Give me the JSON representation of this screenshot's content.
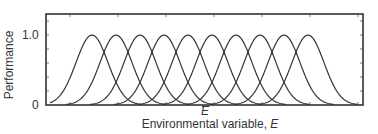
{
  "chart_data": {
    "type": "line",
    "title": "",
    "xlabel": "Environmental variable, E",
    "xlabel_text": "Environmental variable, ",
    "xlabel_var": "E",
    "ylabel": "Performance",
    "yticks": [
      "0",
      "1.0"
    ],
    "ylim": [
      0,
      1.2
    ],
    "annotation": "Ē",
    "annotation_var": "E",
    "grid": false,
    "legend": null,
    "series_shape": "gaussian-like performance curves (bell-shaped), identical width, evenly spaced optima",
    "series": [
      {
        "name": "curve-1",
        "peak_x": 1,
        "peak_y": 1.0
      },
      {
        "name": "curve-2",
        "peak_x": 2,
        "peak_y": 1.0
      },
      {
        "name": "curve-3",
        "peak_x": 3,
        "peak_y": 1.0
      },
      {
        "name": "curve-4",
        "peak_x": 4,
        "peak_y": 1.0
      },
      {
        "name": "curve-5",
        "peak_x": 5,
        "peak_y": 1.0
      },
      {
        "name": "curve-6",
        "peak_x": 6,
        "peak_y": 1.0
      },
      {
        "name": "curve-7",
        "peak_x": 7,
        "peak_y": 1.0
      },
      {
        "name": "curve-8",
        "peak_x": 8,
        "peak_y": 1.0
      },
      {
        "name": "curve-9",
        "peak_x": 9,
        "peak_y": 1.0
      },
      {
        "name": "curve-10",
        "peak_x": 10,
        "peak_y": 1.0
      }
    ],
    "peak_pixel_x": [
      92,
      116,
      140,
      164,
      188,
      212,
      236,
      260,
      284,
      308
    ],
    "curve_sigma_px": 16,
    "frame": {
      "left": 46,
      "top": 14,
      "right": 363,
      "bottom": 105
    },
    "y_pixel": {
      "zero": 105,
      "one": 35
    },
    "curve_color": "#333333"
  }
}
